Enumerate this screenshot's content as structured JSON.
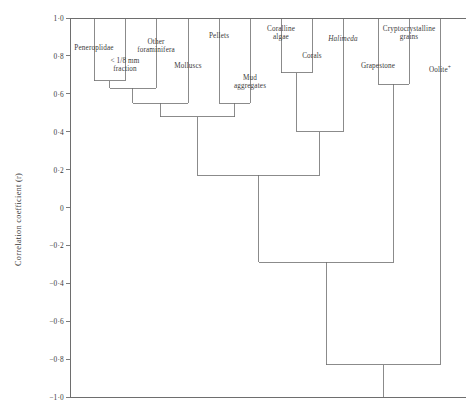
{
  "axis": {
    "title": "Correlation coefficient (r)",
    "tick_labels": [
      "1·0",
      "0·8",
      "0·6",
      "0·4",
      "0·2",
      "0",
      "−0·2",
      "−0·4",
      "−0·6",
      "−0·8",
      "−1·0"
    ],
    "tick_values": [
      1.0,
      0.8,
      0.6,
      0.4,
      0.2,
      0.0,
      -0.2,
      -0.4,
      -0.6,
      -0.8,
      -1.0
    ],
    "ylim": [
      -1.0,
      1.0
    ]
  },
  "chart_data": {
    "type": "dendrogram",
    "title": "",
    "xlabel": "",
    "ylabel": "Correlation coefficient (r)",
    "ylim": [
      -1.0,
      1.0
    ],
    "grid": false,
    "legend": "none",
    "orientation": "top-down",
    "leaf_order": [
      "Peneroplidae",
      "< 1/8 mm fraction",
      "Other foraminifera",
      "Molluscs",
      "Pellets",
      "Mud aggregates",
      "Coralline algae",
      "Corals",
      "Halimeda",
      "Grapestone",
      "Cryptocrystalline grains",
      "Oolite"
    ],
    "leaves": [
      {
        "id": "peneroplidae",
        "label": "Peneroplidae",
        "label_lines": [
          "Peneroplidae"
        ],
        "italic": false,
        "x": 94,
        "label_y": 44
      },
      {
        "id": "fine_fraction",
        "label": "< 1/8 mm fraction",
        "label_lines": [
          "< 1/8 mm",
          "fraction"
        ],
        "italic": false,
        "x": 125,
        "label_y": 57
      },
      {
        "id": "other_foraminifera",
        "label": "Other foraminifera",
        "label_lines": [
          "Other",
          "foraminifera"
        ],
        "italic": false,
        "x": 156,
        "label_y": 38
      },
      {
        "id": "molluscs",
        "label": "Molluscs",
        "label_lines": [
          "Molluscs"
        ],
        "italic": false,
        "x": 188,
        "label_y": 62
      },
      {
        "id": "pellets",
        "label": "Pellets",
        "label_lines": [
          "Pellets"
        ],
        "italic": false,
        "x": 219,
        "label_y": 32
      },
      {
        "id": "mud_aggregates",
        "label": "Mud aggregates",
        "label_lines": [
          "Mud",
          "aggregates"
        ],
        "italic": false,
        "x": 250,
        "label_y": 74
      },
      {
        "id": "coralline_algae",
        "label": "Coralline algae",
        "label_lines": [
          "Coralline",
          "algae"
        ],
        "italic": false,
        "x": 281,
        "label_y": 25
      },
      {
        "id": "corals",
        "label": "Corals",
        "label_lines": [
          "Corals"
        ],
        "italic": false,
        "x": 312,
        "label_y": 52
      },
      {
        "id": "halimeda",
        "label": "Halimeda",
        "label_lines": [
          "Halimeda"
        ],
        "italic": true,
        "x": 343,
        "label_y": 35
      },
      {
        "id": "grapestone",
        "label": "Grapestone",
        "label_lines": [
          "Grapestone"
        ],
        "italic": false,
        "x": 378,
        "label_y": 62
      },
      {
        "id": "cryptocrystalline_grains",
        "label": "Cryptocrystalline grains",
        "label_lines": [
          "Cryptocrystalline",
          "grains"
        ],
        "italic": false,
        "x": 409,
        "label_y": 25
      },
      {
        "id": "oolite",
        "label": "Oolite",
        "label_lines": [
          "Oolite"
        ],
        "superscript": "+",
        "italic": false,
        "x": 440,
        "label_y": 63
      }
    ],
    "merges": [
      {
        "id": "m1",
        "left": "peneroplidae",
        "right": "fine_fraction",
        "r": 0.67
      },
      {
        "id": "m2",
        "left": "m1",
        "right": "other_foraminifera",
        "r": 0.63
      },
      {
        "id": "m3",
        "left": "m2",
        "right": "molluscs",
        "r": 0.55
      },
      {
        "id": "m4",
        "left": "pellets",
        "right": "mud_aggregates",
        "r": 0.55
      },
      {
        "id": "m5",
        "left": "m3",
        "right": "m4",
        "r": 0.48
      },
      {
        "id": "m6",
        "left": "coralline_algae",
        "right": "corals",
        "r": 0.71
      },
      {
        "id": "m7",
        "left": "m6",
        "right": "halimeda",
        "r": 0.4
      },
      {
        "id": "m8",
        "left": "grapestone",
        "right": "cryptocrystalline_grains",
        "r": 0.65
      },
      {
        "id": "m9",
        "left": "m5",
        "right": "m7",
        "r": 0.17
      },
      {
        "id": "m10",
        "left": "m9",
        "right": "m8",
        "r": -0.29
      },
      {
        "id": "m11",
        "left": "m10",
        "right": "oolite",
        "r": -0.83
      }
    ]
  }
}
